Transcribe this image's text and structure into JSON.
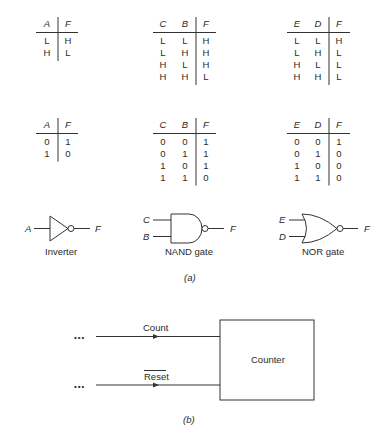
{
  "tables_hl": [
    {
      "name": "inverter-hl",
      "inputs": [
        "A"
      ],
      "output": "F",
      "rows": [
        [
          "L",
          "H"
        ],
        [
          "H",
          "L"
        ]
      ]
    },
    {
      "name": "nand-hl",
      "inputs": [
        "C",
        "B"
      ],
      "output": "F",
      "rows": [
        [
          "L",
          "L",
          "H"
        ],
        [
          "L",
          "H",
          "H"
        ],
        [
          "H",
          "L",
          "H"
        ],
        [
          "H",
          "H",
          "L"
        ]
      ]
    },
    {
      "name": "nor-hl",
      "inputs": [
        "E",
        "D"
      ],
      "output": "F",
      "rows": [
        [
          "L",
          "L",
          "H"
        ],
        [
          "L",
          "H",
          "L"
        ],
        [
          "H",
          "L",
          "L"
        ],
        [
          "H",
          "H",
          "L"
        ]
      ]
    }
  ],
  "tables_01": [
    {
      "name": "inverter-01",
      "inputs": [
        "A"
      ],
      "output": "F",
      "rows": [
        [
          "0",
          "1"
        ],
        [
          "1",
          "0"
        ]
      ]
    },
    {
      "name": "nand-01",
      "inputs": [
        "C",
        "B"
      ],
      "output": "F",
      "rows": [
        [
          "0",
          "0",
          "1"
        ],
        [
          "0",
          "1",
          "1"
        ],
        [
          "1",
          "0",
          "1"
        ],
        [
          "1",
          "1",
          "0"
        ]
      ]
    },
    {
      "name": "nor-01",
      "inputs": [
        "E",
        "D"
      ],
      "output": "F",
      "rows": [
        [
          "0",
          "0",
          "1"
        ],
        [
          "0",
          "1",
          "0"
        ],
        [
          "1",
          "0",
          "0"
        ],
        [
          "1",
          "1",
          "0"
        ]
      ]
    }
  ],
  "gates": {
    "inverter": {
      "input": "A",
      "output": "F",
      "label": "Inverter"
    },
    "nand": {
      "input_top": "C",
      "input_bottom": "B",
      "output": "F",
      "label": "NAND gate"
    },
    "nor": {
      "input_top": "E",
      "input_bottom": "D",
      "output": "F",
      "label": "NOR gate"
    }
  },
  "caption_a": "(a)",
  "counter": {
    "box_label": "Counter",
    "signals": [
      {
        "label": "Count",
        "ellipsis": "•••",
        "inverted": false
      },
      {
        "label": "Reset",
        "ellipsis": "•••",
        "inverted": true
      }
    ]
  },
  "caption_b": "(b)"
}
